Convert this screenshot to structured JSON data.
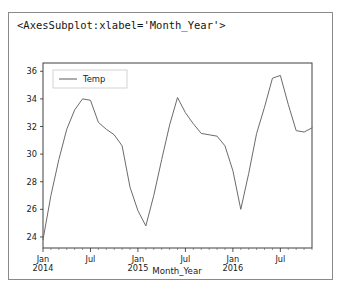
{
  "output_cell": {
    "repr_text": "<AxesSubplot:xlabel='Month_Year'>"
  },
  "chart_data": {
    "type": "line",
    "title": "",
    "xlabel": "Month_Year",
    "ylabel": "",
    "grid": false,
    "legend_position": "upper left",
    "line_color": "#6b6b6b",
    "ylim": [
      23.2,
      36.6
    ],
    "yticks": [
      24,
      26,
      28,
      30,
      32,
      34,
      36
    ],
    "ytick_labels": [
      "24",
      "26",
      "28",
      "30",
      "32",
      "34",
      "36"
    ],
    "xtick_labels": [
      "Jan\n2014",
      "Jul",
      "Jan\n2015",
      "Jul",
      "Jan\n2016",
      "Jul"
    ],
    "xtick_major": [
      {
        "line1": "Jan",
        "line2": "2014"
      },
      {
        "line1": "Jul",
        "line2": ""
      },
      {
        "line1": "Jan",
        "line2": "2015"
      },
      {
        "line1": "Jul",
        "line2": ""
      },
      {
        "line1": "Jan",
        "line2": "2016"
      },
      {
        "line1": "Jul",
        "line2": ""
      }
    ],
    "series": [
      {
        "name": "Temp",
        "x": [
          "Jan 2014",
          "Feb 2014",
          "Mar 2014",
          "Apr 2014",
          "May 2014",
          "Jun 2014",
          "Jul 2014",
          "Aug 2014",
          "Sep 2014",
          "Oct 2014",
          "Nov 2014",
          "Dec 2014",
          "Jan 2015",
          "Feb 2015",
          "Mar 2015",
          "Apr 2015",
          "May 2015",
          "Jun 2015",
          "Jul 2015",
          "Aug 2015",
          "Sep 2015",
          "Oct 2015",
          "Nov 2015",
          "Dec 2015",
          "Jan 2016",
          "Feb 2016",
          "Mar 2016",
          "Apr 2016",
          "May 2016",
          "Jun 2016",
          "Jul 2016",
          "Aug 2016",
          "Sep 2016",
          "Oct 2016",
          "Nov 2016"
        ],
        "values": [
          23.8,
          27.0,
          29.6,
          31.8,
          33.2,
          34.0,
          33.9,
          32.3,
          31.8,
          31.4,
          30.6,
          27.6,
          25.9,
          24.8,
          27.0,
          29.6,
          32.1,
          34.1,
          33.0,
          32.2,
          31.5,
          31.4,
          31.3,
          30.6,
          28.8,
          26.0,
          28.6,
          31.5,
          33.4,
          35.5,
          35.7,
          33.6,
          31.7,
          31.6,
          31.9
        ]
      }
    ]
  },
  "legend": {
    "entries": [
      {
        "label": "Temp",
        "color": "#6b6b6b"
      }
    ]
  }
}
